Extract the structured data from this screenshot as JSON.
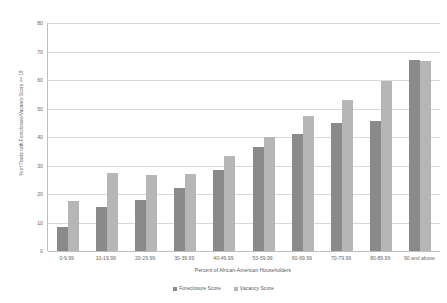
{
  "chart_data": {
    "type": "bar",
    "title": "",
    "subtitle": "",
    "xlabel": "Percent of African-American Householders",
    "ylabel": "% of Tracts with Foreclosure/Vacancy Score >= 18",
    "ylim": [
      0,
      80
    ],
    "ytick_labels": [
      "80",
      "70",
      "60",
      "50",
      "40",
      "30",
      "20",
      "10",
      "0"
    ],
    "ytick_values": [
      80,
      70,
      60,
      50,
      40,
      30,
      20,
      10,
      0
    ],
    "grid": true,
    "legend_position": "bottom",
    "categories": [
      "0-9.99",
      "10-19.99",
      "20-29.99",
      "30-39.99",
      "40-49.99",
      "50-59.99",
      "60-69.99",
      "70-79.99",
      "80-89.99",
      "90 and above"
    ],
    "series": [
      {
        "name": "Foreclosure Score",
        "color": "#8a8a8a",
        "values": [
          8.5,
          15.5,
          18,
          22,
          28.5,
          36.5,
          41,
          45,
          45.5,
          67
        ]
      },
      {
        "name": "Vacancy Score",
        "color": "#b6b6b6",
        "values": [
          17.5,
          27.5,
          26.5,
          27,
          33.5,
          40,
          47.5,
          53,
          59.5,
          66.5
        ]
      }
    ]
  },
  "legend": {
    "entries": [
      {
        "label": "Foreclosure Score"
      },
      {
        "label": "Vacancy Score"
      }
    ]
  },
  "colors": {
    "series_foreclosure": "#8a8a8a",
    "series_vacancy": "#b6b6b6",
    "gridline": "#d9d9d9",
    "axis": "#bfbfbf",
    "text": "#595959",
    "background": "#ffffff"
  }
}
